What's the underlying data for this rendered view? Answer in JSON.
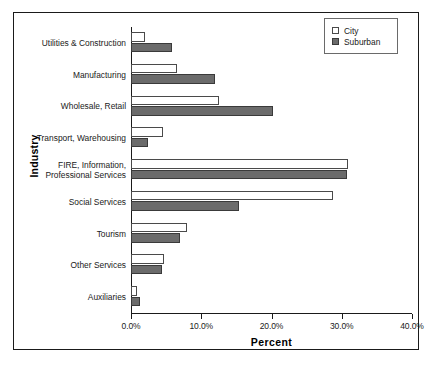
{
  "chart_data": {
    "type": "bar",
    "orientation": "horizontal",
    "title": "",
    "xlabel": "Percent",
    "ylabel": "Industry",
    "xlim": [
      0,
      40
    ],
    "xticks": [
      "0.0%",
      "10.0%",
      "20.0%",
      "30.0%",
      "40.0%"
    ],
    "xtick_values": [
      0,
      10,
      20,
      30,
      40
    ],
    "grid": false,
    "legend_position": "top-right",
    "categories": [
      "Utilities & Construction",
      "Manufacturing",
      "Wholesale, Retail",
      "Transport, Warehousing",
      "FIRE, Information,\nProfessional Services",
      "Social Services",
      "Tourism",
      "Other Services",
      "Auxiliaries"
    ],
    "series": [
      {
        "name": "City",
        "color": "#ffffff",
        "values": [
          2.0,
          6.6,
          12.5,
          4.5,
          30.9,
          28.7,
          8.0,
          4.7,
          0.9
        ]
      },
      {
        "name": "Suburban",
        "color": "#6b6b6b",
        "values": [
          5.8,
          12.0,
          20.2,
          2.4,
          30.8,
          15.4,
          7.0,
          4.4,
          1.3
        ]
      }
    ]
  },
  "legend": {
    "items": [
      {
        "label": "City"
      },
      {
        "label": "Suburban"
      }
    ]
  }
}
